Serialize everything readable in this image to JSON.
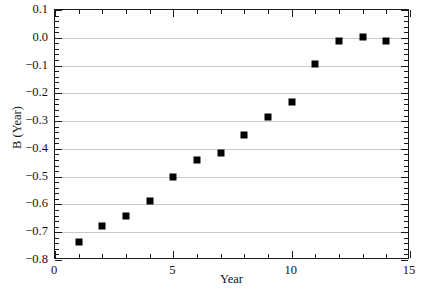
{
  "chart_data": {
    "type": "scatter",
    "title": "",
    "xlabel": "Year",
    "ylabel": "B (Year)",
    "xlim": [
      0,
      15
    ],
    "ylim": [
      -0.8,
      0.1
    ],
    "grid": "horizontal",
    "legend": "none",
    "marker": "filled-square",
    "marker_color": "#000000",
    "x": [
      1,
      2,
      3,
      4,
      5,
      6,
      7,
      8,
      9,
      10,
      11,
      12,
      13,
      14
    ],
    "values": [
      -0.735,
      -0.678,
      -0.64,
      -0.589,
      -0.5,
      -0.441,
      -0.413,
      -0.349,
      -0.285,
      -0.231,
      -0.093,
      -0.01,
      0.002,
      -0.011
    ],
    "xticks": [
      0,
      5,
      10,
      15
    ],
    "xtick_labels": [
      "0",
      "5",
      "10",
      "15"
    ],
    "xtick_minor_step": 1,
    "yticks": [
      0.1,
      0.0,
      -0.1,
      -0.2,
      -0.3,
      -0.4,
      -0.5,
      -0.6,
      -0.7,
      -0.8
    ],
    "ytick_labels": [
      "0.1",
      "0.0",
      "-0.1",
      "-0.2",
      "-0.3",
      "-0.4",
      "-0.5",
      "-0.6",
      "-0.7",
      "-0.8"
    ],
    "ytick_minor_step": 0.02,
    "gridline_color": "#c9c9c9",
    "frame_color": "#1a1a1a"
  }
}
